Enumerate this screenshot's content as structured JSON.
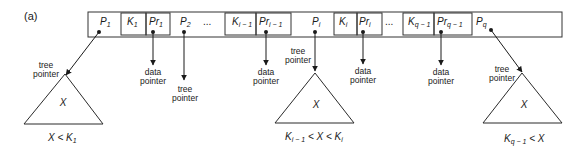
{
  "figure": {
    "label": "(a)"
  },
  "node": {
    "fields": [
      {
        "id": "P1",
        "main": "P",
        "sub": "1",
        "type": "tree-pointer"
      },
      {
        "id": "K1",
        "main": "K",
        "sub": "1",
        "type": "key",
        "boxed": true
      },
      {
        "id": "Pr1",
        "main": "Pr",
        "sub": "1",
        "type": "data-pointer",
        "boxed": true
      },
      {
        "id": "P2",
        "main": "P",
        "sub": "2",
        "type": "tree-pointer"
      },
      {
        "id": "ellipsis1",
        "main": "...",
        "type": "ellipsis"
      },
      {
        "id": "Ki-1",
        "main": "K",
        "sub": "i − 1",
        "type": "key",
        "boxed": true
      },
      {
        "id": "Pri-1",
        "main": "Pr",
        "sub": "i − 1",
        "type": "data-pointer",
        "boxed": true
      },
      {
        "id": "Pi",
        "main": "P",
        "sub": "i",
        "type": "tree-pointer"
      },
      {
        "id": "Ki",
        "main": "K",
        "sub": "i",
        "type": "key",
        "boxed": true
      },
      {
        "id": "Pri",
        "main": "Pr",
        "sub": "i",
        "type": "data-pointer",
        "boxed": true
      },
      {
        "id": "ellipsis2",
        "main": "...",
        "type": "ellipsis"
      },
      {
        "id": "Kq-1",
        "main": "K",
        "sub": "q − 1",
        "type": "key",
        "boxed": true
      },
      {
        "id": "Prq-1",
        "main": "Pr",
        "sub": "q − 1",
        "type": "data-pointer",
        "boxed": true
      },
      {
        "id": "Pq",
        "main": "P",
        "sub": "q",
        "type": "tree-pointer"
      }
    ]
  },
  "pointer_labels": {
    "tree_line1": "tree",
    "tree_line2": "pointer",
    "data_line1": "data",
    "data_line2": "pointer"
  },
  "subtrees": [
    {
      "label": "X",
      "condition": {
        "parts": [
          "X < K",
          "1",
          ""
        ]
      }
    },
    {
      "label": "X",
      "condition": {
        "parts": [
          "K",
          "i − 1",
          " < X < K",
          "i"
        ]
      }
    },
    {
      "label": "X",
      "condition": {
        "parts": [
          "K",
          "q − 1",
          " < X"
        ]
      }
    }
  ]
}
